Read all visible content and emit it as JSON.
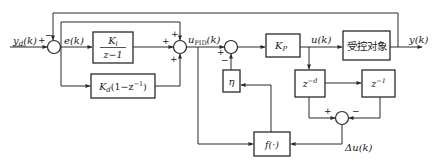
{
  "diagram": {
    "type": "control-block-diagram",
    "signals": {
      "reference": "y_d(k)",
      "reference_base": "y",
      "reference_sub": "d",
      "reference_arg": "(k)",
      "error": "e(k)",
      "pid_output_base": "u",
      "pid_output_sub": "PID",
      "pid_output_arg": "(k)",
      "control": "u(k)",
      "output": "y(k)",
      "delta_u": "Δu(k)"
    },
    "blocks": {
      "integral": {
        "numerator": "K",
        "numerator_sub": "i",
        "denominator": "z−1"
      },
      "derivative": {
        "label_base": "K",
        "label_sub": "d",
        "label_rest": "(1−z",
        "label_sup": "−1",
        "label_close": ")"
      },
      "proportional": {
        "label_base": "K",
        "label_sub": "P"
      },
      "plant": {
        "label": "受控对象"
      },
      "eta": {
        "label": "η"
      },
      "delay_d": {
        "base": "z",
        "sup": "−d"
      },
      "delay_1": {
        "base": "z",
        "sup": "−1"
      },
      "nonlinear": {
        "label": "f(·)"
      }
    },
    "junction_signs": {
      "sum1": {
        "left": "+",
        "top": "−"
      },
      "sum2": {
        "top": "+",
        "left": "+",
        "bottom": "+"
      },
      "sum3": {
        "left": "+",
        "bottom": "−"
      },
      "sum4": {
        "left": "+",
        "right": "−"
      }
    },
    "colors": {
      "line": "#2a2a2a",
      "text": "#1a1a1a",
      "background": "#ffffff"
    }
  }
}
